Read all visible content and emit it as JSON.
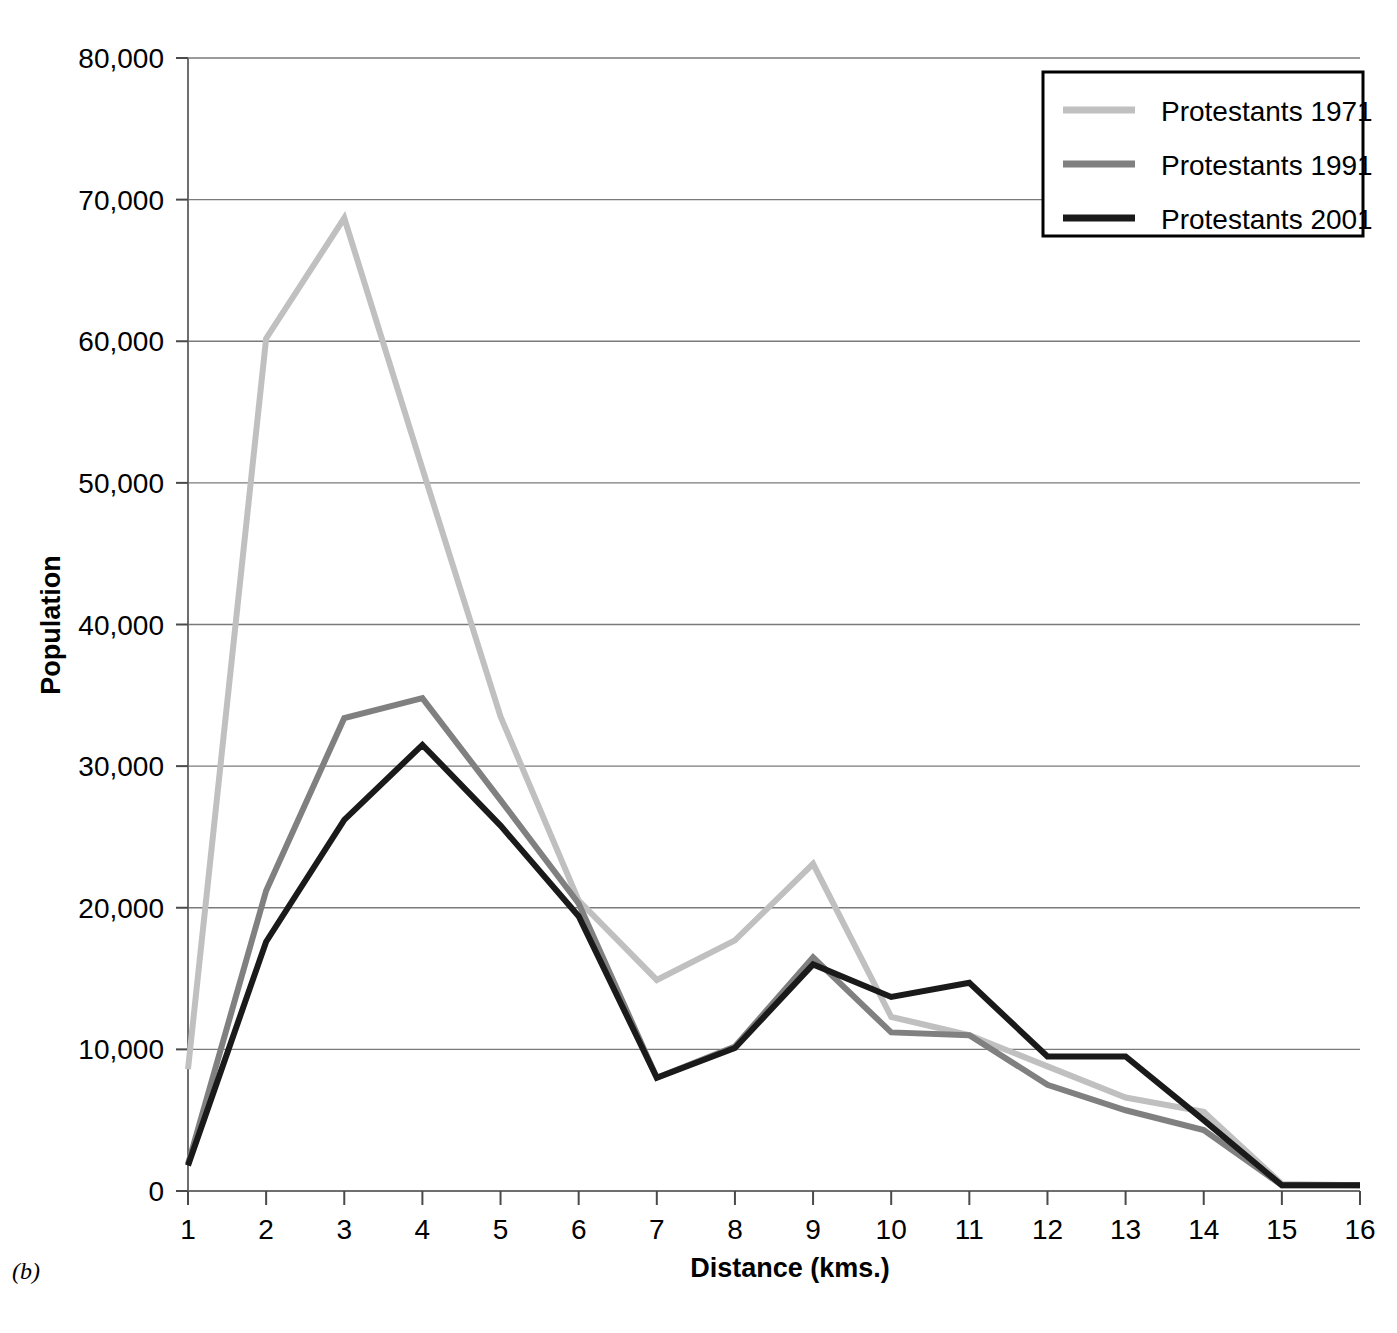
{
  "figure": {
    "panel_caption": "(b)"
  },
  "chart_data": {
    "type": "line",
    "title": "",
    "xlabel": "Distance (kms.)",
    "ylabel": "Population",
    "x": [
      1,
      2,
      3,
      4,
      5,
      6,
      7,
      8,
      9,
      10,
      11,
      12,
      13,
      14,
      15,
      16
    ],
    "categories": [
      "1",
      "2",
      "3",
      "4",
      "5",
      "6",
      "7",
      "8",
      "9",
      "10",
      "11",
      "12",
      "13",
      "14",
      "15",
      "16"
    ],
    "xlim": [
      1,
      16
    ],
    "ylim": [
      0,
      80000
    ],
    "yticks": [
      0,
      10000,
      20000,
      30000,
      40000,
      50000,
      60000,
      70000,
      80000
    ],
    "ytick_labels": [
      "0",
      "10,000",
      "20,000",
      "30,000",
      "40,000",
      "50,000",
      "60,000",
      "70,000",
      "80,000"
    ],
    "grid": true,
    "grid_axis": "y",
    "legend_position": "top-right",
    "series": [
      {
        "name": "Protestants 1971",
        "color": "#c0c0c0",
        "values": [
          8600,
          60200,
          68700,
          51000,
          33500,
          20500,
          14900,
          17700,
          23100,
          12300,
          11000,
          8800,
          6600,
          5600,
          500,
          400
        ]
      },
      {
        "name": "Protestants 1991",
        "color": "#808080",
        "values": [
          1900,
          21200,
          33400,
          34800,
          27600,
          20300,
          8000,
          10200,
          16500,
          11200,
          11000,
          7500,
          5700,
          4300,
          400,
          400
        ]
      },
      {
        "name": "Protestants 2001",
        "color": "#1a1a1a",
        "values": [
          1800,
          17600,
          26200,
          31500,
          25800,
          19400,
          8000,
          10100,
          16000,
          13700,
          14700,
          9500,
          9500,
          5000,
          400,
          400
        ]
      }
    ]
  },
  "legend": {
    "entries": [
      {
        "label": "Protestants 1971"
      },
      {
        "label": "Protestants 1991"
      },
      {
        "label": "Protestants 2001"
      }
    ]
  }
}
